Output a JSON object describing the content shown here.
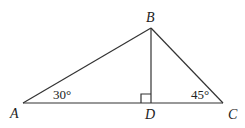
{
  "diagram": {
    "type": "triangle",
    "points": {
      "A": {
        "label": "A",
        "x": 23,
        "y": 103
      },
      "B": {
        "label": "B",
        "x": 151,
        "y": 28
      },
      "C": {
        "label": "C",
        "x": 223,
        "y": 103
      },
      "D": {
        "label": "D",
        "x": 151,
        "y": 103
      }
    },
    "segments": [
      "AB",
      "BC",
      "AC",
      "BD"
    ],
    "angles": {
      "A": "30°",
      "C": "45°"
    },
    "right_angle_at": "D",
    "stroke_color": "#333333"
  }
}
